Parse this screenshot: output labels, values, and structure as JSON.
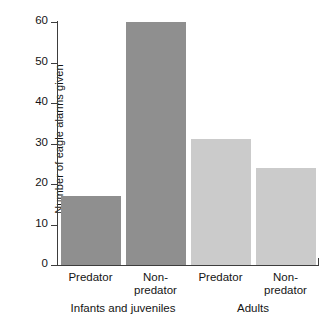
{
  "chart_data": {
    "type": "bar",
    "title": "",
    "xlabel": "",
    "ylabel": "Number of eagle alarms given",
    "ylim": [
      0,
      60
    ],
    "yticks": [
      0,
      10,
      20,
      30,
      40,
      50,
      60
    ],
    "grid": false,
    "legend": false,
    "categories": [
      "Predator",
      "Non-predator",
      "Predator",
      "Non-predator"
    ],
    "values": [
      17,
      60,
      31,
      24
    ],
    "groups": [
      {
        "label": "Infants and juveniles",
        "categories": [
          "Predator",
          "Non-predator"
        ],
        "values": [
          17,
          60
        ],
        "color": "#8f8f8f"
      },
      {
        "label": "Adults",
        "categories": [
          "Predator",
          "Non-predator"
        ],
        "values": [
          31,
          24
        ],
        "color": "#cbcbcb"
      }
    ],
    "bars": [
      {
        "label_line1": "Predator",
        "label_line2": "",
        "value": 17,
        "group": "Infants and juveniles",
        "color": "#8f8f8f"
      },
      {
        "label_line1": "Non-",
        "label_line2": "predator",
        "value": 60,
        "group": "Infants and juveniles",
        "color": "#8f8f8f"
      },
      {
        "label_line1": "Predator",
        "label_line2": "",
        "value": 31,
        "group": "Adults",
        "color": "#cbcbcb"
      },
      {
        "label_line1": "Non-",
        "label_line2": "predator",
        "value": 24,
        "group": "Adults",
        "color": "#cbcbcb"
      }
    ],
    "colors": {
      "infants_bars": "#8f8f8f",
      "adults_bars": "#cbcbcb",
      "axis": "#3d3d3d",
      "text": "#141414",
      "background": "#ffffff"
    }
  },
  "axis": {
    "y_tick_labels": [
      "0",
      "10",
      "20",
      "30",
      "40",
      "50",
      "60"
    ],
    "y_title": "Number of eagle alarms given"
  },
  "xlabels": {
    "b0_line1": "Predator",
    "b0_line2": "",
    "b1_line1": "Non-",
    "b1_line2": "predator",
    "b2_line1": "Predator",
    "b2_line2": "",
    "b3_line1": "Non-",
    "b3_line2": "predator",
    "group0": "Infants and juveniles",
    "group1": "Adults"
  }
}
